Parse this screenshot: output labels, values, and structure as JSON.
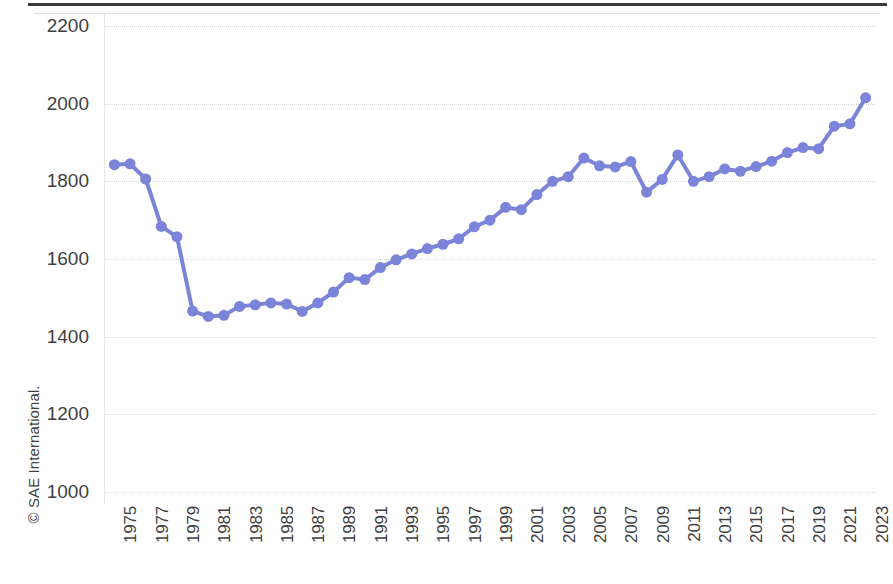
{
  "figure": {
    "credit": "© SAE International."
  },
  "chart_data": {
    "type": "line",
    "title": "",
    "subtitle": "",
    "xlabel": "",
    "ylabel": "",
    "xlim": [
      1974.4,
      2023.6
    ],
    "ylim": [
      1000,
      2200
    ],
    "ytick_step": 200,
    "yticks": [
      1000,
      1200,
      1400,
      1600,
      1800,
      2000,
      2200
    ],
    "ytick_labels": [
      "1000",
      "1200",
      "1400",
      "1600",
      "1800",
      "2000",
      "2200"
    ],
    "xtick_step": 2,
    "xticks": [
      1975,
      1977,
      1979,
      1981,
      1983,
      1985,
      1987,
      1989,
      1991,
      1993,
      1995,
      1997,
      1999,
      2001,
      2003,
      2005,
      2007,
      2009,
      2011,
      2013,
      2015,
      2017,
      2019,
      2021,
      2023
    ],
    "xtick_labels": [
      "1975",
      "1977",
      "1979",
      "1981",
      "1983",
      "1985",
      "1987",
      "1989",
      "1991",
      "1993",
      "1995",
      "1997",
      "1999",
      "2001",
      "2003",
      "2005",
      "2007",
      "2009",
      "2011",
      "2013",
      "2015",
      "2017",
      "2019",
      "2021",
      "2023"
    ],
    "xtick_rotation": 90,
    "grid": "horizontal-dotted",
    "legend": "none",
    "marker": "circle",
    "marker_size": 8,
    "line_width": 4,
    "series_color": "#7b84d8",
    "categories": [
      1975,
      1976,
      1977,
      1978,
      1979,
      1980,
      1981,
      1982,
      1983,
      1984,
      1985,
      1986,
      1987,
      1988,
      1989,
      1990,
      1991,
      1992,
      1993,
      1994,
      1995,
      1996,
      1997,
      1998,
      1999,
      2000,
      2001,
      2002,
      2003,
      2004,
      2005,
      2006,
      2007,
      2008,
      2009,
      2010,
      2011,
      2012,
      2013,
      2014,
      2015,
      2016,
      2017,
      2018,
      2019,
      2020,
      2021,
      2022,
      2023
    ],
    "values": [
      1843,
      1845,
      1806,
      1684,
      1657,
      1466,
      1452,
      1455,
      1478,
      1482,
      1487,
      1484,
      1465,
      1487,
      1515,
      1552,
      1547,
      1578,
      1598,
      1613,
      1627,
      1638,
      1652,
      1683,
      1700,
      1733,
      1727,
      1766,
      1800,
      1812,
      1860,
      1840,
      1837,
      1851,
      1772,
      1805,
      1868,
      1800,
      1812,
      1832,
      1826,
      1838,
      1852,
      1874,
      1887,
      1884,
      1942,
      1948,
      2015
    ],
    "series": [
      {
        "name": "",
        "color": "#7b84d8",
        "values": [
          1843,
          1845,
          1806,
          1684,
          1657,
          1466,
          1452,
          1455,
          1478,
          1482,
          1487,
          1484,
          1465,
          1487,
          1515,
          1552,
          1547,
          1578,
          1598,
          1613,
          1627,
          1638,
          1652,
          1683,
          1700,
          1733,
          1727,
          1766,
          1800,
          1812,
          1860,
          1840,
          1837,
          1851,
          1772,
          1805,
          1868,
          1800,
          1812,
          1832,
          1826,
          1838,
          1852,
          1874,
          1887,
          1884,
          1942,
          1948,
          2015
        ]
      }
    ],
    "annotations": []
  }
}
